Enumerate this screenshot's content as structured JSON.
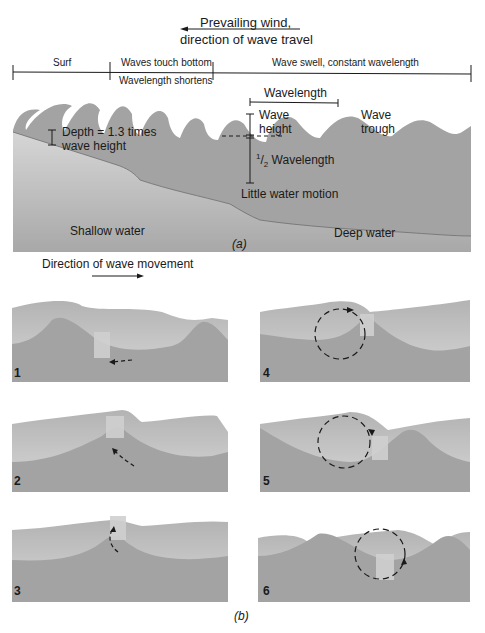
{
  "figure": {
    "part_a_label": "(a)",
    "part_b_label": "(b)",
    "colors": {
      "water_dark": "#9b9b9b",
      "water_mid": "#a9a9a9",
      "water_light": "#c9c9c9",
      "seafloor": "#b4b4b4",
      "line": "#1a1a1a",
      "background": "#ffffff"
    }
  },
  "part_a": {
    "wind_label_line1": "Prevailing wind,",
    "wind_label_line2": "direction of wave travel",
    "wind_arrow_direction": "left",
    "zones": [
      {
        "top": "Surf",
        "bottom": ""
      },
      {
        "top": "Waves touch bottom",
        "bottom": "Wavelength shortens"
      },
      {
        "top": "Wave swell, constant wavelength",
        "bottom": ""
      }
    ],
    "labels": {
      "wavelength": "Wavelength",
      "wave_height_1": "Wave",
      "wave_height_2": "height",
      "wave_trough_1": "Wave",
      "wave_trough_2": "trough",
      "depth_1": "Depth = 1.3 times",
      "depth_2": "wave height",
      "half_wavelength_num": "1",
      "half_wavelength_den": "2",
      "half_wavelength_text": " Wavelength",
      "little_motion": "Little water motion",
      "shallow_water": "Shallow water",
      "deep_water": "Deep water"
    }
  },
  "part_b": {
    "direction_label": "Direction of wave movement",
    "direction_arrow": "right",
    "panels": [
      {
        "number": "1",
        "arrow": "dashed arrow moving left along trough bottom"
      },
      {
        "number": "2",
        "arrow": "dashed arrow moving up slope toward crest"
      },
      {
        "number": "3",
        "arrow": "curved dashed arrow rising to crest"
      },
      {
        "number": "4",
        "arrow": "dashed circular orbit, object at crest"
      },
      {
        "number": "5",
        "arrow": "dashed circular orbit, object descending"
      },
      {
        "number": "6",
        "arrow": "dashed circular orbit, object at trough"
      }
    ]
  }
}
